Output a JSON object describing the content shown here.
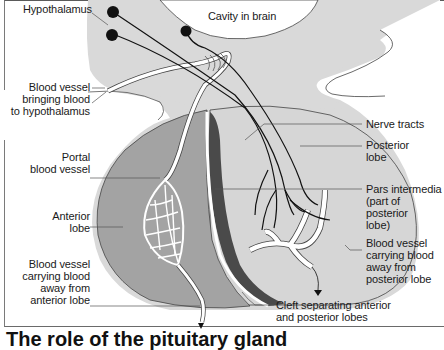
{
  "figure": {
    "title": "The role of the pituitary gland",
    "colors": {
      "brain_tissue": "#d9d9d9",
      "anterior_lobe": "#a3a3a3",
      "posterior_lobe": "#d6d6d6",
      "pars_intermedia": "#4a4a4a",
      "vessel": "#ffffff",
      "nerve": "#111111",
      "leader_line": "#555555"
    }
  },
  "labels": {
    "hypothalamus": "Hypothalamus",
    "cavity": "Cavity in brain",
    "blood_vessel_in": [
      "Blood vessel",
      "bringing blood",
      "to hypothalamus"
    ],
    "portal": [
      "Portal",
      "blood vessel"
    ],
    "anterior_lobe": [
      "Anterior",
      "lobe"
    ],
    "vessel_out_anterior": [
      "Blood vessel",
      "carrying blood",
      "away from",
      "anterior lobe"
    ],
    "nerve_tracts": "Nerve tracts",
    "posterior_lobe": [
      "Posterior",
      "lobe"
    ],
    "pars_intermedia": [
      "Pars intermedia",
      "(part of posterior",
      "lobe)"
    ],
    "vessel_out_posterior": [
      "Blood vessel",
      "carrying blood",
      "away from",
      "posterior lobe"
    ],
    "cleft": [
      "Cleft separating anterior",
      "and posterior lobes"
    ]
  }
}
